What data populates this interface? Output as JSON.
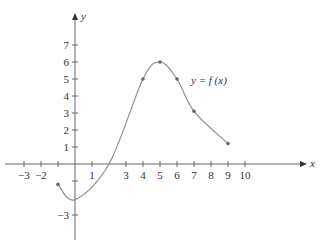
{
  "chart_data": {
    "type": "line",
    "title": "",
    "xlabel": "x",
    "ylabel": "y",
    "annotation": "y = f (x)",
    "x_ticks": [
      -3,
      -2,
      -1,
      1,
      3,
      4,
      5,
      6,
      7,
      8,
      9,
      10
    ],
    "x_tick_labels": [
      "−3",
      "−2",
      "",
      "1",
      "3",
      "4",
      "5",
      "6",
      "7",
      "8",
      "9",
      "10"
    ],
    "y_ticks": [
      -3,
      -1,
      1,
      2,
      3,
      4,
      5,
      6,
      7
    ],
    "y_tick_labels": [
      "−3",
      "",
      "1",
      "2",
      "3",
      "4",
      "5",
      "6",
      "7"
    ],
    "xlim": [
      -4,
      13
    ],
    "ylim": [
      -4.5,
      9
    ],
    "grid": false,
    "series": [
      {
        "name": "f(x)",
        "x": [
          -1,
          0,
          2,
          4,
          5,
          6,
          7,
          9
        ],
        "y": [
          -1.2,
          -2.1,
          0,
          5,
          6,
          5,
          3.1,
          1.2
        ],
        "marked_points": [
          [
            -1,
            -1.2
          ],
          [
            4,
            5
          ],
          [
            5,
            6
          ],
          [
            6,
            5
          ],
          [
            7,
            3.1
          ],
          [
            9,
            1.2
          ]
        ]
      }
    ],
    "colors": {
      "curve": "#777777",
      "axis": "#555555",
      "text": "#333333"
    }
  }
}
